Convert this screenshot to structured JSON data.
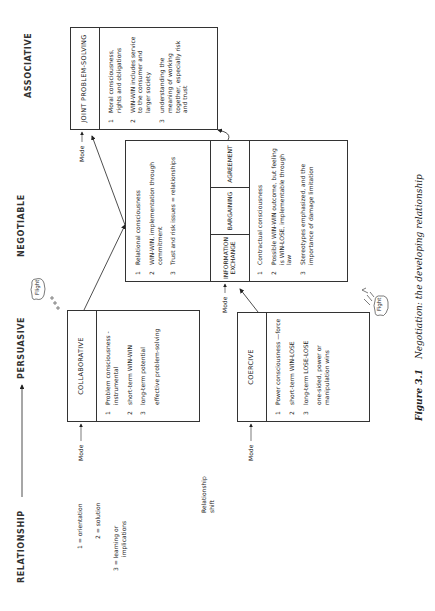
{
  "headers": {
    "relationship": "RELATIONSHIP",
    "persuasive": "PERSUASIVE",
    "negotiable": "NEGOTIABLE",
    "associative": "ASSOCIATIVE"
  },
  "legend": {
    "items": [
      "1 = orientation",
      "2 = solution",
      "3 = learning or",
      "implications"
    ],
    "relationship_shift": [
      "Relationship",
      "shift"
    ]
  },
  "mode_label": "Mode",
  "boxes": {
    "collaborative": {
      "title": "COLLABORATIVE",
      "items": [
        {
          "num": "1",
          "text": "Problem consciousness -instrumental"
        },
        {
          "num": "2",
          "text": "short-term WIN-WIN"
        },
        {
          "num": "3",
          "text": "long-term potential"
        }
      ],
      "note": "effective problem-solving"
    },
    "coercive": {
      "title": "COERCIVE",
      "items": [
        {
          "num": "1",
          "text": "Power consciousness —force"
        },
        {
          "num": "2",
          "text": "short-term WIN-LOSE"
        },
        {
          "num": "3",
          "text": "long-term LOSE-LOSE"
        }
      ],
      "note": "one-sided, power or manipulation wins"
    },
    "negotiable": {
      "upper_items": [
        {
          "num": "1",
          "text": "Relational consciousness"
        },
        {
          "num": "2",
          "text": "WIN-WIN, implementation through commitment"
        },
        {
          "num": "3",
          "text": "Trust and risk issues = relationships"
        }
      ],
      "columns": [
        "INFORMATION EXCHANGE",
        "BARGAINING",
        "AGREEMENT"
      ],
      "lower_items": [
        {
          "num": "1",
          "text": "Contractual consciousness"
        },
        {
          "num": "2",
          "text": "Possible WIN-WIN outcome, but feeling is WIN-LOSE, implementable through law"
        },
        {
          "num": "3",
          "text": "Stereotypes emphasized, and the importance of damage limitation"
        }
      ]
    },
    "joint": {
      "title": "JOINT PROBLEM-SOLVING",
      "items": [
        {
          "num": "1",
          "text": "Moral consciousness, rights and obligations"
        },
        {
          "num": "2",
          "text": "WIN-WIN includes service to the consumer and larger society"
        },
        {
          "num": "3",
          "text": "understanding the meaning of working together, especially risk and trust"
        }
      ]
    }
  },
  "bubbles": {
    "flight": "Flight",
    "fight": "Fight"
  },
  "caption": {
    "figure": "Figure 3.1",
    "text": "Negotiation: the developing relationship"
  }
}
